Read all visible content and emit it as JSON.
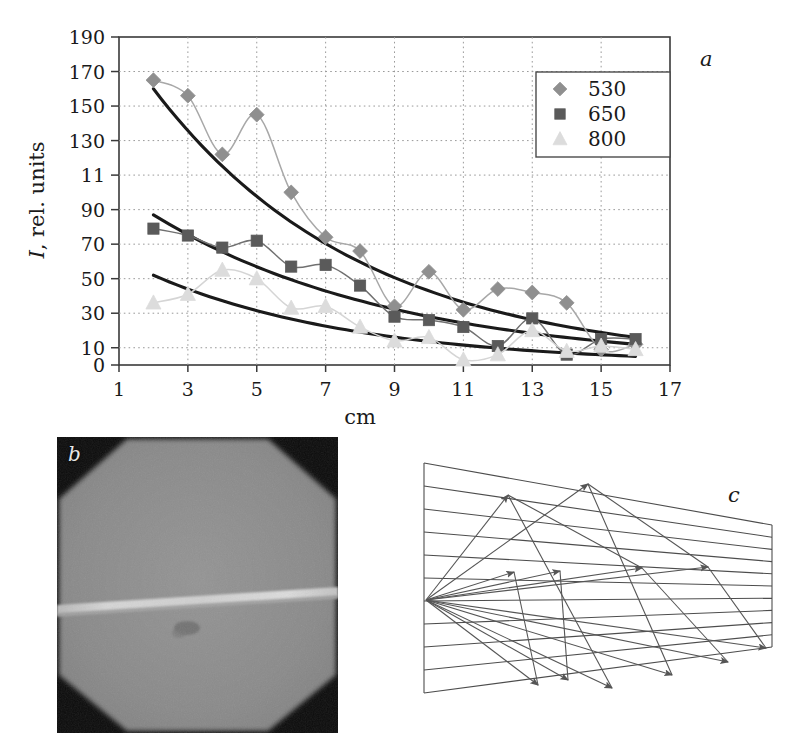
{
  "figure": {
    "panels": [
      {
        "id": "a",
        "letter": "a",
        "kind": "chart"
      },
      {
        "id": "b",
        "letter": "b",
        "kind": "photograph"
      },
      {
        "id": "c",
        "letter": "c",
        "kind": "ray-diagram"
      }
    ]
  },
  "chart_data": {
    "type": "line",
    "title": "",
    "xlabel": "cm",
    "ylabel": "I, rel. units",
    "ylabel_italic_prefix": "I",
    "ylabel_rest": ", rel. units",
    "xlim": [
      1,
      17
    ],
    "ylim": [
      0,
      190
    ],
    "grid": true,
    "legend_position": "top-right",
    "xticks": [
      1,
      3,
      5,
      7,
      9,
      11,
      13,
      15,
      17
    ],
    "xtick_labels": [
      "1",
      "3",
      "5",
      "7",
      "9",
      "11",
      "13",
      "15",
      "17"
    ],
    "yticks": [
      0,
      10,
      30,
      50,
      70,
      90,
      110,
      130,
      150,
      170,
      190
    ],
    "ytick_labels": [
      "0",
      "10",
      "30",
      "50",
      "70",
      "90",
      "11",
      "130",
      "150",
      "170",
      "190"
    ],
    "x": [
      2,
      3,
      4,
      5,
      6,
      7,
      8,
      9,
      10,
      11,
      12,
      13,
      14,
      15,
      16
    ],
    "series": [
      {
        "name": "530",
        "marker": "diamond",
        "color": "#8f8f8f",
        "line_color": "#a8a8a8",
        "values": [
          165,
          156,
          122,
          145,
          100,
          74,
          66,
          34,
          54,
          32,
          44,
          42,
          36,
          9,
          12
        ]
      },
      {
        "name": "650",
        "marker": "square",
        "color": "#5a5a5a",
        "line_color": "#707070",
        "values": [
          79,
          75,
          68,
          72,
          57,
          58,
          46,
          28,
          26,
          22,
          11,
          27,
          6,
          15,
          15
        ]
      },
      {
        "name": "800",
        "marker": "triangle",
        "color": "#dcdcdc",
        "line_color": "#d5d5d5",
        "values": [
          36,
          41,
          55,
          50,
          33,
          34,
          22,
          14,
          16,
          3,
          6,
          20,
          8,
          11,
          9
        ]
      }
    ],
    "trend_curves": [
      {
        "for_series": "530",
        "color": "#1a1a1a",
        "start": [
          2,
          160
        ],
        "end": [
          16,
          16
        ],
        "description": "exponential decay fit through the 530 nm points"
      },
      {
        "for_series": "650",
        "color": "#1a1a1a",
        "start": [
          2,
          87
        ],
        "end": [
          16,
          12
        ],
        "description": "exponential decay fit through the 650 nm points"
      },
      {
        "for_series": "800",
        "color": "#1a1a1a",
        "start": [
          2,
          52
        ],
        "end": [
          16,
          5
        ],
        "description": "exponential decay fit through the 800 nm points"
      }
    ],
    "legend": [
      {
        "label": "530",
        "marker": "diamond",
        "color": "#8f8f8f"
      },
      {
        "label": "650",
        "marker": "square",
        "color": "#5a5a5a"
      },
      {
        "label": "800",
        "marker": "triangle",
        "color": "#dcdcdc"
      }
    ]
  },
  "panel_b": {
    "letter": "b",
    "description": "grayscale photograph of a bright horizontal streak across a uniform gray field with dark octagonal corner vignetting",
    "background_gray": "#8b8b8b",
    "corner_gray": "#0d0d0d",
    "streak_gray": "#d8d8d8"
  },
  "panel_c": {
    "letter": "c",
    "description": "schematic wedge-shaped slab drawn in perspective with horizontal layer lines and ray arrows diverging from a source point on the left edge",
    "line_color": "#4d4d4d"
  }
}
